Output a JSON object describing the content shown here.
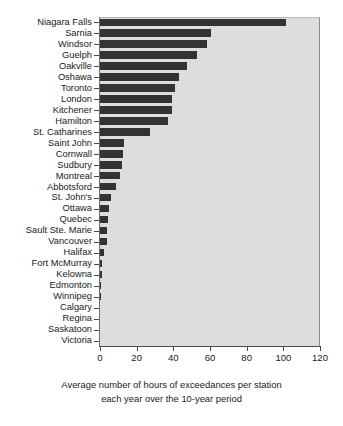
{
  "chart_data": {
    "type": "bar",
    "orientation": "horizontal",
    "title": "",
    "subtitle": "",
    "xlabel": "Average number of hours of exceedances per station each year over the 10-year period",
    "ylabel": "",
    "xlim": [
      0,
      120
    ],
    "xticks": [
      0,
      20,
      40,
      60,
      80,
      100,
      120
    ],
    "xtick_labels": [
      "0",
      "20",
      "40",
      "60",
      "80",
      "100",
      "120"
    ],
    "grid": false,
    "legend": null,
    "legend_position": "none",
    "bar_color": "#333333",
    "plot_background": "#dddddd",
    "figure_background": "#ffffff",
    "categories": [
      "Niagara Falls",
      "Sarnia",
      "Windsor",
      "Guelph",
      "Oakville",
      "Oshawa",
      "Toronto",
      "London",
      "Kitchener",
      "Hamilton",
      "St. Catharines",
      "Saint John",
      "Cornwall",
      "Sudbury",
      "Montreal",
      "Abbotsford",
      "St. John's",
      "Ottawa",
      "Quebec",
      "Sault Ste. Marie",
      "Vancouver",
      "Halifax",
      "Fort McMurray",
      "Kelowna",
      "Edmonton",
      "Winnipeg",
      "Calgary",
      "Regina",
      "Saskatoon",
      "Victoria"
    ],
    "values": [
      101.5,
      60.5,
      58.5,
      53.0,
      47.5,
      43.0,
      41.0,
      39.5,
      39.5,
      37.0,
      27.5,
      13.0,
      12.5,
      12.0,
      11.0,
      8.5,
      6.0,
      5.0,
      4.5,
      4.0,
      3.8,
      2.0,
      1.3,
      1.2,
      0.7,
      0.4,
      0.15,
      0.1,
      0.05,
      0.0
    ]
  },
  "caption": {
    "line1": "Average number of hours of exceedances per station",
    "line2": "each year over the 10-year period"
  }
}
